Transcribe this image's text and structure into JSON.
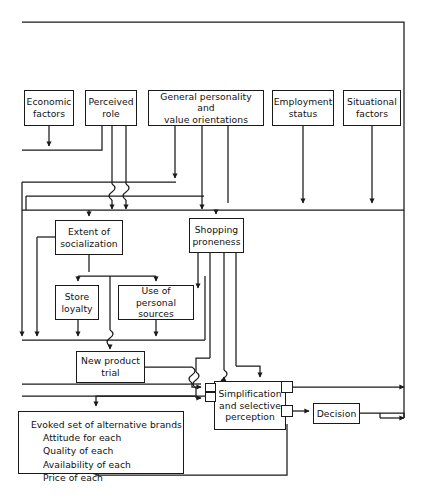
{
  "diagram": {
    "type": "flowchart",
    "stroke_color": "#1a1a1a",
    "background_color": "#ffffff",
    "width": 423,
    "height": 502
  },
  "nodes": [
    {
      "id": "economic-factors",
      "label": "Economic\nfactors",
      "x": 24,
      "y": 90,
      "w": 50,
      "h": 36
    },
    {
      "id": "perceived-role",
      "label": "Perceived\nrole",
      "x": 85,
      "y": 90,
      "w": 52,
      "h": 36
    },
    {
      "id": "general-personality",
      "label": "General personality and\nvalue orientations",
      "x": 148,
      "y": 90,
      "w": 116,
      "h": 36
    },
    {
      "id": "employment-status",
      "label": "Employment\nstatus",
      "x": 272,
      "y": 90,
      "w": 62,
      "h": 36
    },
    {
      "id": "situational-factors",
      "label": "Situational\nfactors",
      "x": 343,
      "y": 90,
      "w": 58,
      "h": 36
    },
    {
      "id": "extent-socialization",
      "label": "Extent of\nsocialization",
      "x": 55,
      "y": 220,
      "w": 68,
      "h": 35
    },
    {
      "id": "shopping-proneness",
      "label": "Shopping\nproneness",
      "x": 189,
      "y": 218,
      "w": 55,
      "h": 35
    },
    {
      "id": "store-loyalty",
      "label": "Store\nloyalty",
      "x": 55,
      "y": 285,
      "w": 44,
      "h": 35
    },
    {
      "id": "use-personal-sources",
      "label": "Use of personal\nsources",
      "x": 118,
      "y": 285,
      "w": 76,
      "h": 35
    },
    {
      "id": "new-product-trial",
      "label": "New product\ntrial",
      "x": 76,
      "y": 351,
      "w": 69,
      "h": 32
    },
    {
      "id": "simplification",
      "label": "Simplification\nand selective\nperception",
      "x": 214,
      "y": 381,
      "w": 72,
      "h": 49
    },
    {
      "id": "decision",
      "label": "Decision",
      "x": 313,
      "y": 403,
      "w": 47,
      "h": 21
    }
  ],
  "evoked_set": {
    "id": "evoked-set",
    "heading": "Evoked set of alternative brands",
    "items": "Attitude for each\nQuality of each\nAvailability of each\nPrice of each",
    "x": 18,
    "y": 411,
    "w": 166,
    "h": 63
  },
  "junction_boxes": [
    {
      "id": "junction-simplification-in-left",
      "x": 205,
      "y": 387,
      "w": 11,
      "h": 10
    },
    {
      "id": "junction-simplification-in-left2",
      "x": 205,
      "y": 400,
      "w": 11,
      "h": 10
    },
    {
      "id": "junction-simplification-top-right",
      "x": 281,
      "y": 381,
      "w": 12,
      "h": 12
    },
    {
      "id": "junction-simplification-bot-right",
      "x": 281,
      "y": 405,
      "w": 12,
      "h": 12
    }
  ],
  "edges": [
    {
      "id": "edge-economic-to-bus",
      "from": "economic-factors",
      "to": "left-return-bus"
    },
    {
      "id": "edge-perceived-to-socialization",
      "from": "perceived-role",
      "to": "extent-socialization"
    },
    {
      "id": "edge-personality-to-socialization",
      "from": "general-personality",
      "to": "extent-socialization"
    },
    {
      "id": "edge-personality-to-shopping",
      "from": "general-personality",
      "to": "shopping-proneness"
    },
    {
      "id": "edge-employment-to-bus",
      "from": "employment-status",
      "to": "main-horizontal-bus"
    },
    {
      "id": "edge-situational-to-bus",
      "from": "situational-factors",
      "to": "main-horizontal-bus"
    },
    {
      "id": "edge-socialization-to-store-loyalty",
      "from": "extent-socialization",
      "to": "store-loyalty"
    },
    {
      "id": "edge-socialization-to-sources",
      "from": "extent-socialization",
      "to": "use-personal-sources"
    },
    {
      "id": "edge-store-loyalty-to-trial",
      "from": "store-loyalty",
      "to": "new-product-trial"
    },
    {
      "id": "edge-sources-to-trial",
      "from": "use-personal-sources",
      "to": "new-product-trial"
    },
    {
      "id": "edge-shopping-to-simplification",
      "from": "shopping-proneness",
      "to": "simplification"
    },
    {
      "id": "edge-trial-to-simplification",
      "from": "new-product-trial",
      "to": "simplification"
    },
    {
      "id": "edge-evoked-to-simplification",
      "from": "evoked-set",
      "to": "simplification"
    },
    {
      "id": "edge-simplification-to-decision",
      "from": "simplification",
      "to": "decision"
    },
    {
      "id": "edge-simplification-to-right-bus",
      "from": "simplification",
      "to": "right-return-bus"
    },
    {
      "id": "edge-decision-to-right-bus",
      "from": "decision",
      "to": "right-return-bus"
    },
    {
      "id": "edge-feedback-to-evoked",
      "from": "decision",
      "to": "evoked-set"
    },
    {
      "id": "edge-right-bus-to-top",
      "from": "right-return-bus",
      "to": "top-return-bus"
    }
  ]
}
